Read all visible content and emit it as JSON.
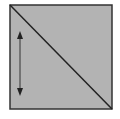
{
  "diagram": {
    "square": {
      "x": 10,
      "y": 5,
      "width": 102,
      "height": 104,
      "fill": "#b3b3b3",
      "stroke": "#333333"
    },
    "diagonal": {
      "x1": 10,
      "y1": 5,
      "x2": 112,
      "y2": 109,
      "stroke": "#222222"
    },
    "arrow": {
      "x": 20,
      "y1": 32,
      "y2": 95,
      "direction": "bidirectional-vertical",
      "stroke": "#333333"
    }
  }
}
